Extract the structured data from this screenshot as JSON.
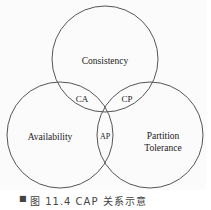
{
  "diagram": {
    "title": "CAP",
    "sets": [
      {
        "id": "consistency",
        "label": "Consistency"
      },
      {
        "id": "availability",
        "label": "Availability"
      },
      {
        "id": "partition-tolerance",
        "label_lines": [
          "Partition",
          "Tolerance"
        ]
      }
    ],
    "intersections": [
      {
        "id": "ca",
        "label": "CA",
        "sets": [
          "consistency",
          "availability"
        ]
      },
      {
        "id": "cp",
        "label": "CP",
        "sets": [
          "consistency",
          "partition-tolerance"
        ]
      },
      {
        "id": "ap",
        "label": "AP",
        "sets": [
          "availability",
          "partition-tolerance"
        ]
      }
    ],
    "stroke_color": "#555555"
  },
  "caption": {
    "bullet": "■",
    "text": "图 11.4  CAP 关系示意"
  }
}
